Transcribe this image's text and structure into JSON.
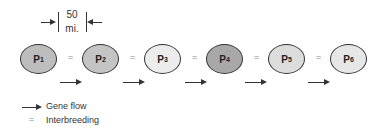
{
  "scale": {
    "value": "50",
    "unit": "mi."
  },
  "populations": [
    {
      "label": "P",
      "sub": "1",
      "color": "#bdbdbd"
    },
    {
      "label": "P",
      "sub": "2",
      "color": "#c4c4c4"
    },
    {
      "label": "P",
      "sub": "3",
      "color": "#ececec"
    },
    {
      "label": "P",
      "sub": "4",
      "color": "#a8a8a8"
    },
    {
      "label": "P",
      "sub": "5",
      "color": "#dcdcdc"
    },
    {
      "label": "P",
      "sub": "6",
      "color": "#e6e6e6"
    }
  ],
  "interbreeding_symbol": "=",
  "legend": {
    "gene_flow": "Gene flow",
    "interbreeding_symbol": "=",
    "interbreeding": "Interbreeding"
  }
}
